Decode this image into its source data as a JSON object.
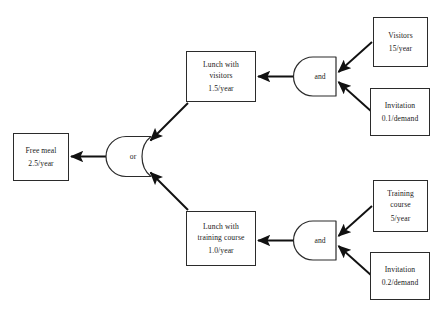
{
  "diagram": {
    "background_color": "#ffffff",
    "line_color": "#2b2b2b",
    "text_color": "#1a1a1a",
    "nodes": [
      {
        "id": "free-meal",
        "label": "Free meal",
        "rate": "2.5/year"
      },
      {
        "id": "lunch-with-visitors",
        "label_line1": "Lunch with",
        "label_line2": "visitors",
        "rate": "1.5/year"
      },
      {
        "id": "lunch-with-training-course",
        "label_line1": "Lunch with",
        "label_line2": "training course",
        "rate": "1.0/year"
      },
      {
        "id": "visitors",
        "label": "Visitors",
        "rate": "15/year"
      },
      {
        "id": "invitation-visitors",
        "label": "Invitation",
        "rate": "0.1/demand"
      },
      {
        "id": "training-course",
        "label_line1": "Training",
        "label_line2": "course",
        "rate": "5/year"
      },
      {
        "id": "invitation-training",
        "label": "Invitation",
        "rate": "0.2/demand"
      }
    ],
    "gates": [
      {
        "id": "or-gate-free-meal",
        "label": "or"
      },
      {
        "id": "and-gate-visitors",
        "label": "and"
      },
      {
        "id": "and-gate-training",
        "label": "and"
      }
    ]
  }
}
